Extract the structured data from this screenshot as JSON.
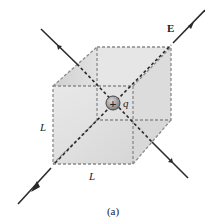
{
  "figure": {
    "caption": "(a)",
    "field_label": "E",
    "charge_label": "q",
    "charge_sign": "+",
    "edge_label_vertical": "L",
    "edge_label_horizontal": "L"
  },
  "colors": {
    "line": "#2a2a2a",
    "cube_face": "#e4e4e4",
    "cube_face_dark": "#cfcfcf",
    "edge_dash": "#8a8a8a",
    "charge_fill": "#9a9a9a"
  }
}
